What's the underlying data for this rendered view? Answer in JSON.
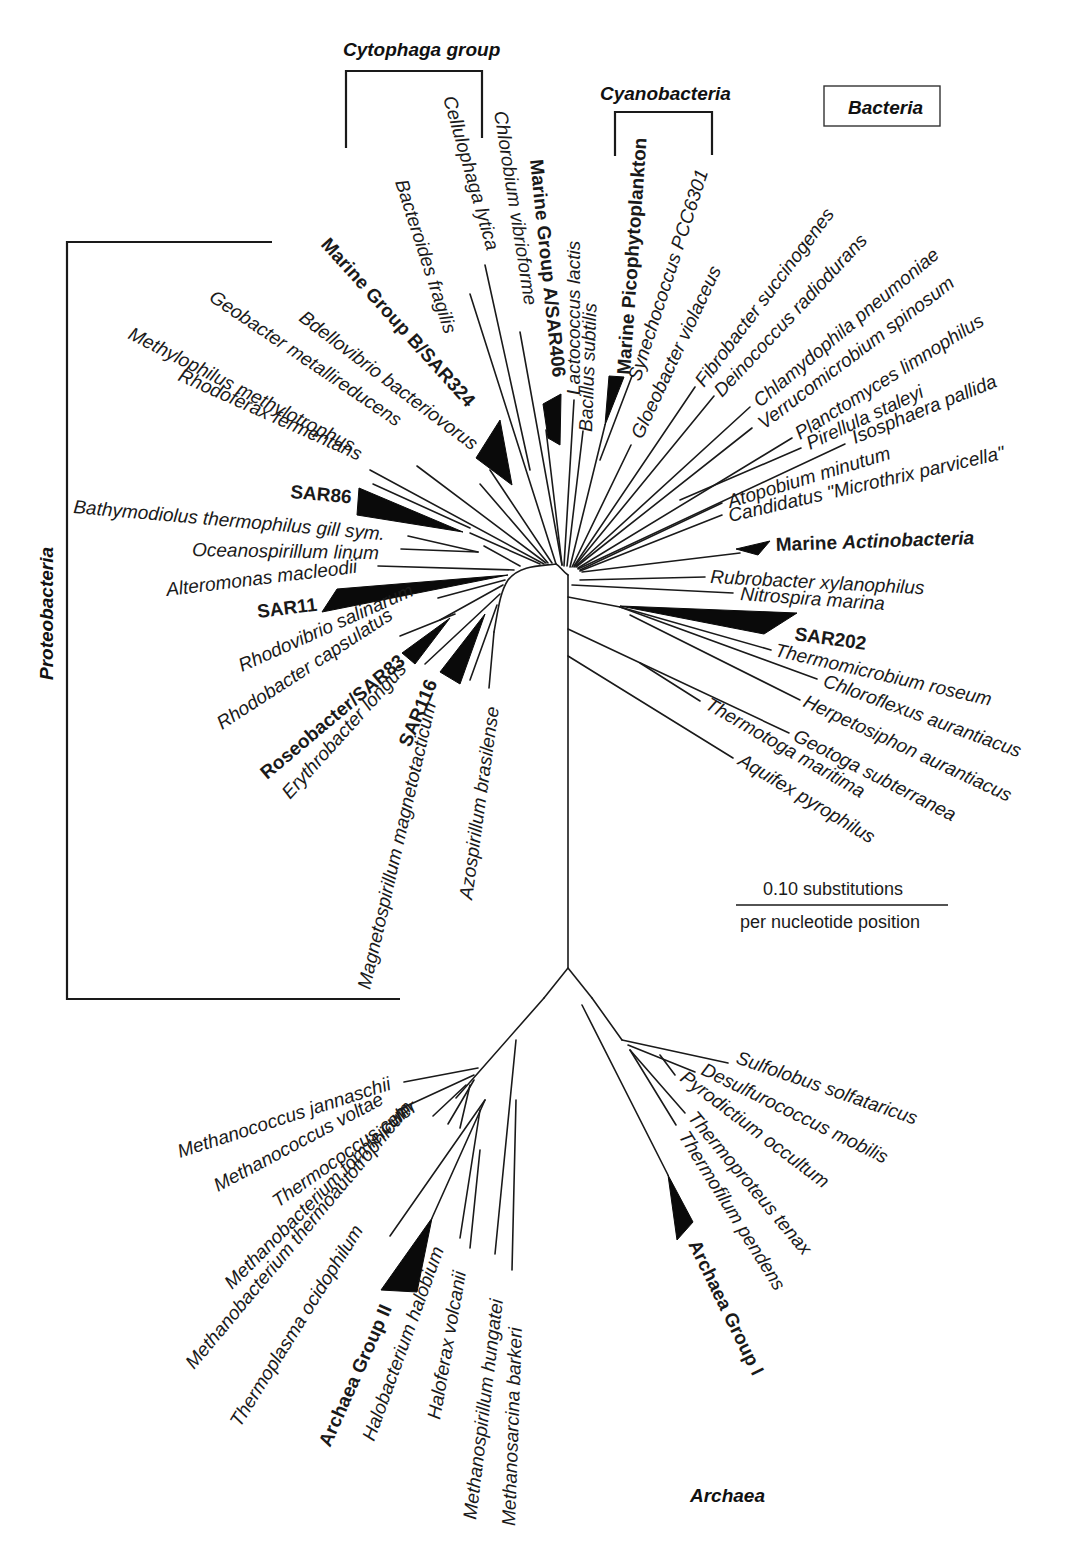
{
  "domains": {
    "bacteria": "Bacteria",
    "archaea": "Archaea"
  },
  "groups": {
    "cytophaga": "Cytophaga group",
    "cyanobacteria": "Cyanobacteria",
    "proteobacteria": "Proteobacteria"
  },
  "scale_bar": {
    "top": "0.10 substitutions",
    "bottom": "per nucleotide position"
  },
  "taxa": {
    "bacteroides": "Bacteroides fragilis",
    "cellulophaga": "Cellulophaga lytica",
    "chlorobium": "Chlorobium vibrioforme",
    "mgA": "Marine Group A/SAR406",
    "lactococcus": "Lactococcus lactis",
    "bacillus": "Bacillus subtilis",
    "picophyto": "Marine Picophytoplankton",
    "synechococcus": "Synechococcus PCC6301",
    "gloeobacter": "Gloeobacter violaceus",
    "fibrobacter": "Fibrobacter succinogenes",
    "deinococcus": "Deinococcus radiodurans",
    "chlamydophila": "Chlamydophila pneumoniae",
    "verrucomicrobium": "Verrucomicrobium spinosum",
    "planctomyces": "Planctomyces limnophilus",
    "pirellula": "Pirellula staleyi",
    "isosphaera": "Isosphaera pallida",
    "atopobium": "Atopobium minutum",
    "candidatus": "Candidatus \"Microthrix parvicella\"",
    "marine_actino_1": "Marine ",
    "marine_actino_2": "Actinobacteria",
    "rubrobacter": "Rubrobacter xylanophilus",
    "nitrospira": "Nitrospira marina",
    "sar202": "SAR202",
    "thermomicrobium": "Thermomicrobium roseum",
    "chloroflexus": "Chloroflexus aurantiacus",
    "herpetosiphon": "Herpetosiphon aurantiacus",
    "geotoga": "Geotoga subterranea",
    "thermotoga": "Thermotoga maritima",
    "aquifex": "Aquifex pyrophilus",
    "mgB": "Marine Group B/SAR324",
    "bdellovibrio": "Bdellovibrio bacteriovorus",
    "geobacter": "Geobacter metallireducens",
    "methylophilus": "Methylophilus methylotrophus",
    "rhodoferax": "Rhodoferax fermentans",
    "sar86": "SAR86",
    "bathymodiolus": "Bathymodiolus thermophilus gill sym.",
    "oceanospirillum": "Oceanospirillum linum",
    "alteromonas": "Alteromonas macleodii",
    "sar11": "SAR11",
    "rhodovibrio": "Rhodovibrio salinarum",
    "rhodobacter": "Rhodobacter capsulatus",
    "roseobacter": "Roseobacter/SAR83",
    "erythrobacter": "Erythrobacter longus",
    "sar116": "SAR116",
    "magnetospirillum": "Magnetospirillum magnetotacticum",
    "azospirillum": "Azospirillum brasilense",
    "mjannaschii": "Methanococcus jannaschii",
    "mvoltae": "Methanococcus voltae",
    "thermococcus": "Thermococcus celer",
    "mformicicum": "Methanobacterium formicicum",
    "mthermo": "Methanobacterium thermoautotrophicum",
    "thermoplasma": "Thermoplasma ocidophilum",
    "archaea2": "Archaea Group II",
    "halobacterium": "Halobacterium halobium",
    "haloferax": "Haloferax volcanii",
    "methanospirillum": "Methanospirillum hungatei",
    "methanosarcina": "Methanosarcina barkeri",
    "sulfolobus": "Sulfolobus solfataricus",
    "desulfurococcus": "Desulfurococcus mobilis",
    "pyrodictium": "Pyrodictium occultum",
    "thermoproteus": "Thermoproteus tenax",
    "thermofilum": "Thermofilum pendens",
    "archaea1": "Archaea Group I"
  }
}
